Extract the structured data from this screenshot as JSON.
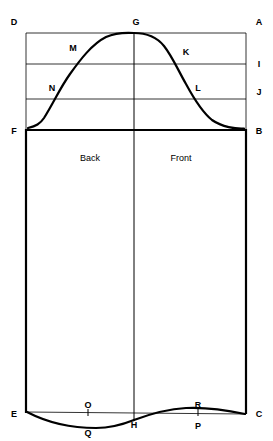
{
  "diagram": {
    "background_color": "#ffffff",
    "line_color": "#000000",
    "width": 273,
    "height": 441,
    "region_labels": [
      {
        "id": "back",
        "text": "Back",
        "x": 90,
        "y": 161
      },
      {
        "id": "front",
        "text": "Front",
        "x": 181,
        "y": 161
      }
    ],
    "point_labels": [
      {
        "id": "D",
        "text": "D",
        "x": 14,
        "y": 25
      },
      {
        "id": "G",
        "text": "G",
        "x": 136,
        "y": 25
      },
      {
        "id": "A",
        "text": "A",
        "x": 259,
        "y": 25
      },
      {
        "id": "M",
        "text": "M",
        "x": 73,
        "y": 51
      },
      {
        "id": "K",
        "text": "K",
        "x": 186,
        "y": 55
      },
      {
        "id": "I",
        "text": "I",
        "x": 259,
        "y": 67
      },
      {
        "id": "N",
        "text": "N",
        "x": 52,
        "y": 91
      },
      {
        "id": "L",
        "text": "L",
        "x": 198,
        "y": 91
      },
      {
        "id": "J",
        "text": "J",
        "x": 259,
        "y": 95
      },
      {
        "id": "F",
        "text": "F",
        "x": 14,
        "y": 134
      },
      {
        "id": "B",
        "text": "B",
        "x": 259,
        "y": 134
      },
      {
        "id": "O",
        "text": "O",
        "x": 88,
        "y": 408
      },
      {
        "id": "R",
        "text": "R",
        "x": 198,
        "y": 408
      },
      {
        "id": "E",
        "text": "E",
        "x": 14,
        "y": 417
      },
      {
        "id": "C",
        "text": "C",
        "x": 259,
        "y": 417
      },
      {
        "id": "H",
        "text": "H",
        "x": 134,
        "y": 428
      },
      {
        "id": "P",
        "text": "P",
        "x": 198,
        "y": 429
      },
      {
        "id": "Q",
        "text": "Q",
        "x": 88,
        "y": 436
      }
    ],
    "geometry": {
      "left_x": 26,
      "right_x": 246,
      "center_x": 134,
      "top_y": 33,
      "line_i_y": 64,
      "line_j_y": 99,
      "line_fb_y": 130,
      "bottom_y": 412,
      "cap_curve_left": "M 28 128 C 36 126 40 124 44 118 C 54 102 60 88 70 74 C 80 60 92 44 106 37 C 116 32.5 126 32.5 134 33",
      "cap_curve_right": "M 134 33 C 146 33 156 36 164 46 C 172 56 178 70 186 84 C 193 97 202 112 212 120 C 222 127 236 129 244 128.5",
      "hem_curve_left": "M 28 412 C 50 424 72 428 96 428 C 112 428 124 424 134 420",
      "hem_curve_right": "M 134 420 C 150 414 168 409 186 408 C 204 407 226 410 244 414",
      "hem_baseline": "M 28 412 L 244 414"
    }
  }
}
